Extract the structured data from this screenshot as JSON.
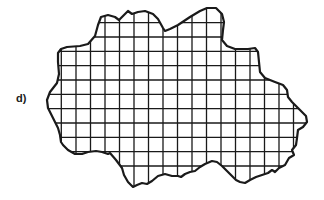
{
  "figure": {
    "label": "d)",
    "colors": {
      "background": "#ffffff",
      "ink": "#1a1a1a"
    },
    "grid": {
      "vertical_lines_x": [
        61.3,
        76,
        90.5,
        105,
        119.5,
        134,
        148.5,
        163,
        177.5,
        192,
        206.5,
        221,
        235.5,
        250,
        264.5,
        279,
        293.5
      ],
      "horizontal_lines_y": [
        22.7,
        37,
        51.3,
        65.7,
        80,
        94.3,
        108.7,
        123,
        137.3,
        151.7,
        166
      ],
      "cell_size_px": 14.4
    },
    "outline_points": [
      [
        57,
        83
      ],
      [
        59,
        74
      ],
      [
        58,
        62
      ],
      [
        58,
        53
      ],
      [
        61,
        49
      ],
      [
        67,
        47
      ],
      [
        80,
        46
      ],
      [
        88,
        44
      ],
      [
        95,
        36
      ],
      [
        98,
        25
      ],
      [
        101,
        17
      ],
      [
        108,
        15
      ],
      [
        115,
        17
      ],
      [
        119,
        20
      ],
      [
        124,
        15
      ],
      [
        128,
        11
      ],
      [
        132,
        14
      ],
      [
        138,
        12
      ],
      [
        145,
        11
      ],
      [
        153,
        14
      ],
      [
        158,
        19
      ],
      [
        163,
        28
      ],
      [
        165,
        31
      ],
      [
        170,
        29
      ],
      [
        178,
        25
      ],
      [
        190,
        17
      ],
      [
        200,
        11
      ],
      [
        207,
        8
      ],
      [
        216,
        8
      ],
      [
        222,
        14
      ],
      [
        224,
        22
      ],
      [
        223,
        30
      ],
      [
        222,
        40
      ],
      [
        227,
        46
      ],
      [
        235,
        49
      ],
      [
        248,
        49
      ],
      [
        255,
        48
      ],
      [
        258,
        52
      ],
      [
        259,
        62
      ],
      [
        260,
        72
      ],
      [
        265,
        78
      ],
      [
        275,
        82
      ],
      [
        283,
        85
      ],
      [
        287,
        90
      ],
      [
        288,
        97
      ],
      [
        292,
        102
      ],
      [
        300,
        110
      ],
      [
        306,
        116
      ],
      [
        307,
        122
      ],
      [
        303,
        127
      ],
      [
        298,
        130
      ],
      [
        297,
        138
      ],
      [
        296,
        145
      ],
      [
        292,
        150
      ],
      [
        294,
        155
      ],
      [
        289,
        158
      ],
      [
        285,
        165
      ],
      [
        279,
        168
      ],
      [
        275,
        172
      ],
      [
        272,
        170
      ],
      [
        268,
        173
      ],
      [
        262,
        175
      ],
      [
        256,
        177
      ],
      [
        250,
        180
      ],
      [
        245,
        183
      ],
      [
        240,
        182
      ],
      [
        236,
        180
      ],
      [
        232,
        176
      ],
      [
        222,
        166
      ],
      [
        217,
        162
      ],
      [
        212,
        161
      ],
      [
        205,
        164
      ],
      [
        200,
        167
      ],
      [
        195,
        171
      ],
      [
        190,
        172
      ],
      [
        185,
        174
      ],
      [
        181,
        177
      ],
      [
        178,
        176
      ],
      [
        172,
        176
      ],
      [
        165,
        174
      ],
      [
        158,
        176
      ],
      [
        152,
        181
      ],
      [
        147,
        184
      ],
      [
        142,
        183
      ],
      [
        137,
        185
      ],
      [
        133,
        187
      ],
      [
        128,
        182
      ],
      [
        124,
        175
      ],
      [
        122,
        168
      ],
      [
        116,
        160
      ],
      [
        110,
        153
      ],
      [
        108,
        154
      ],
      [
        102,
        152
      ],
      [
        96,
        151
      ],
      [
        88,
        152
      ],
      [
        82,
        154
      ],
      [
        75,
        154
      ],
      [
        68,
        150
      ],
      [
        63,
        145
      ],
      [
        61,
        142
      ],
      [
        60,
        135
      ],
      [
        58,
        128
      ],
      [
        53,
        118
      ],
      [
        48,
        108
      ],
      [
        47,
        100
      ],
      [
        50,
        92
      ]
    ]
  }
}
